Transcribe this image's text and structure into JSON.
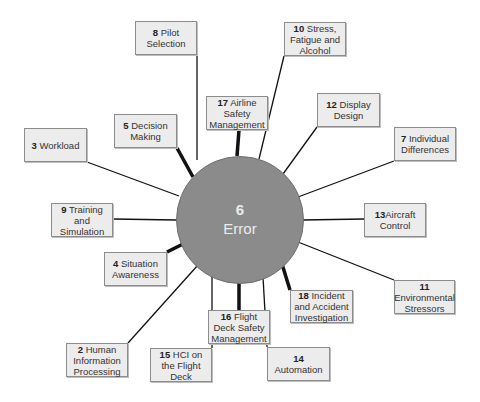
{
  "hub": {
    "number": "6",
    "label": "Error",
    "cx": 239,
    "cy": 219,
    "r": 63,
    "color": "#8b8b8b"
  },
  "nodes": [
    {
      "id": "8",
      "number": "8",
      "text": " Pilot Selection",
      "x": 135,
      "y": 21,
      "w": 62,
      "h": 34,
      "lx": 197,
      "ly": 160,
      "thick": false
    },
    {
      "id": "10",
      "number": "10",
      "text": " Stress, Fatigue and Alcohol",
      "x": 284,
      "y": 22,
      "w": 62,
      "h": 34,
      "lx": 259,
      "ly": 159,
      "thick": false
    },
    {
      "id": "17",
      "number": "17",
      "text": " Airline Safety Management",
      "x": 206,
      "y": 96,
      "w": 62,
      "h": 34,
      "lx": 237,
      "ly": 156,
      "thick": true
    },
    {
      "id": "12",
      "number": "12",
      "text": " Display Design",
      "x": 317,
      "y": 93,
      "w": 63,
      "h": 34,
      "lx": 283,
      "ly": 174,
      "thick": false
    },
    {
      "id": "5",
      "number": "5",
      "text": " Decision Making",
      "x": 114,
      "y": 114,
      "w": 63,
      "h": 34,
      "lx": 193,
      "ly": 177,
      "thick": true
    },
    {
      "id": "3",
      "number": "3",
      "text": " Workload",
      "x": 24,
      "y": 128,
      "w": 63,
      "h": 34,
      "lx": 179,
      "ly": 196,
      "thick": false
    },
    {
      "id": "7",
      "number": "7",
      "text": " Individual Differences",
      "x": 394,
      "y": 127,
      "w": 62,
      "h": 34,
      "lx": 298,
      "ly": 197,
      "thick": false
    },
    {
      "id": "9",
      "number": "9",
      "text": " Training and Simulation",
      "x": 51,
      "y": 203,
      "w": 62,
      "h": 34,
      "lx": 176,
      "ly": 220,
      "thick": false
    },
    {
      "id": "13",
      "number": "13",
      "text": "Aircraft Control",
      "x": 364,
      "y": 203,
      "w": 62,
      "h": 34,
      "lx": 302,
      "ly": 220,
      "thick": false
    },
    {
      "id": "4",
      "number": "4",
      "text": " Situation Awareness",
      "x": 104,
      "y": 252,
      "w": 63,
      "h": 34,
      "lx": 183,
      "ly": 244,
      "thick": true
    },
    {
      "id": "11",
      "number": "11",
      "text": " Environmental Stressors",
      "x": 394,
      "y": 280,
      "w": 61,
      "h": 34,
      "lx": 298,
      "ly": 242,
      "thick": false
    },
    {
      "id": "18",
      "number": "18",
      "text": " Incident and Accident Investigation",
      "x": 290,
      "y": 290,
      "w": 63,
      "h": 33,
      "lx": 282,
      "ly": 264,
      "thick": true
    },
    {
      "id": "16",
      "number": "16",
      "text": " Flight Deck Safety Management",
      "x": 208,
      "y": 310,
      "w": 62,
      "h": 34,
      "lx": 239,
      "ly": 282,
      "thick": true
    },
    {
      "id": "2",
      "number": "2",
      "text": " Human Information Processing",
      "x": 66,
      "y": 343,
      "w": 62,
      "h": 34,
      "lx": 198,
      "ly": 265,
      "thick": false
    },
    {
      "id": "15",
      "number": "15",
      "text": " HCI on the Flight Deck",
      "x": 150,
      "y": 348,
      "w": 62,
      "h": 34,
      "lx": 212,
      "ly": 276,
      "thick": false
    },
    {
      "id": "14",
      "number": "14",
      "text": " Automation",
      "x": 267,
      "y": 347,
      "w": 63,
      "h": 34,
      "lx": 263,
      "ly": 277,
      "thick": false
    }
  ],
  "colors": {
    "box_fill": "#ececec",
    "box_border": "#8c8c8c",
    "line": "#111111",
    "hub_text": "#ececec"
  }
}
